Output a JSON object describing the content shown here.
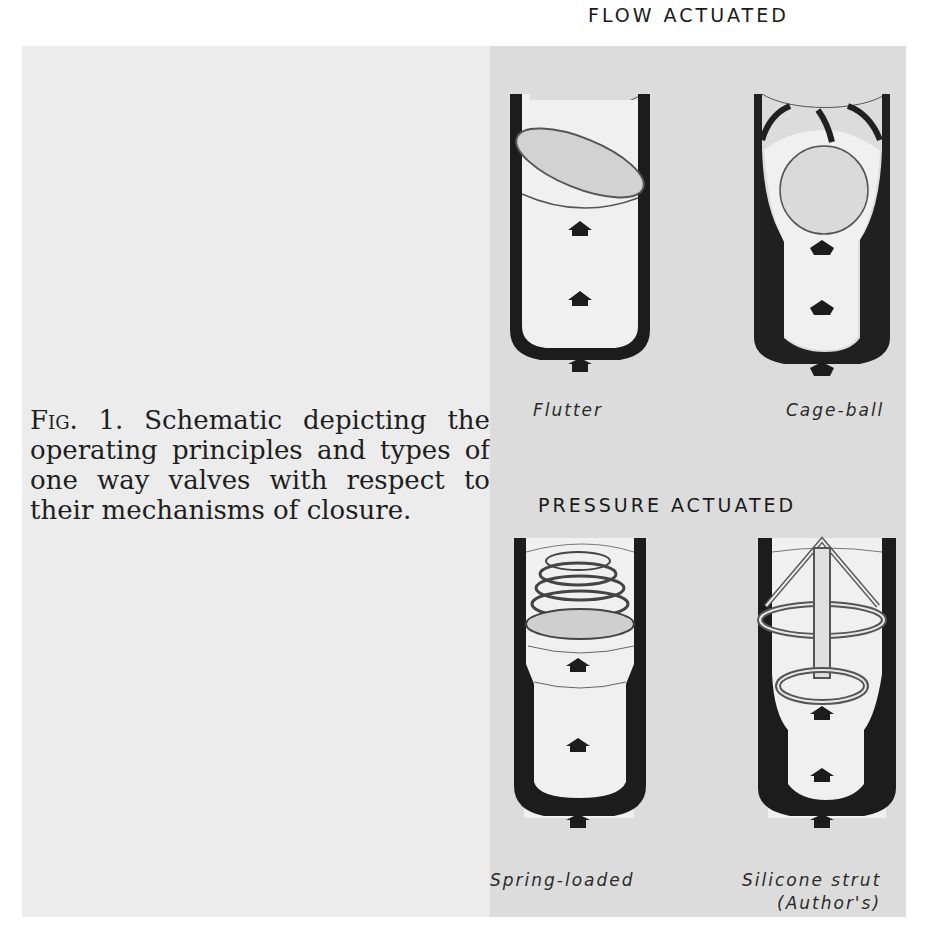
{
  "caption": {
    "figure_label": "Fig. 1.",
    "text": "Schematic depicting the operating principles and types of one way valves with respect to their mechanisms of closure."
  },
  "figure": {
    "sections": [
      {
        "title": "FLOW ACTUATED",
        "valves": [
          {
            "label": "Flutter",
            "icon": "flutter-valve"
          },
          {
            "label": "Cage-ball",
            "icon": "cage-ball-valve"
          }
        ]
      },
      {
        "title": "PRESSURE ACTUATED",
        "valves": [
          {
            "label": "Spring-loaded",
            "icon": "spring-loaded-valve"
          },
          {
            "label": "Silicone strut",
            "sublabel": "(Author's)",
            "icon": "silicone-strut-valve"
          }
        ]
      }
    ],
    "colors": {
      "wall": "#1c1c1c",
      "panel_bg": "#dcdcdc",
      "page_bg": "#ececec",
      "interior": "#f0f0f0"
    }
  }
}
